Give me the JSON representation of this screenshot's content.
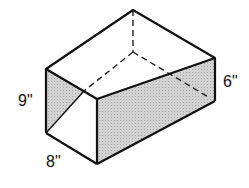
{
  "diagram": {
    "type": "rectangular-prism",
    "labels": {
      "height": "9\"",
      "width": "8\"",
      "depth": "6\""
    },
    "colors": {
      "stroke": "#111111",
      "shade": "#c8c8c8",
      "background": "#ffffff"
    }
  }
}
